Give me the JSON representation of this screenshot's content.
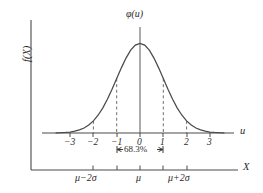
{
  "chart_data": {
    "type": "line",
    "title": "",
    "subtitle": "",
    "curve_label": "φ(u)",
    "ylabel": "f(X)",
    "xlabel_top": "u",
    "xlabel_bottom": "X",
    "distribution": "standard normal probability density",
    "formula": "phi(u) = (1/sqrt(2*pi)) * exp(-u^2/2)",
    "u_axis": {
      "label": "u",
      "ticks": [
        "−3",
        "−2",
        "−1",
        "0",
        "1",
        "2",
        "3"
      ],
      "tick_values": [
        -3,
        -2,
        -1,
        0,
        1,
        2,
        3
      ],
      "xlim": [
        -3.8,
        4.1
      ]
    },
    "x_axis": {
      "label": "X",
      "ticks": [
        "μ−2σ",
        "μ",
        "μ+2σ"
      ],
      "tick_values": [
        -2,
        0,
        2
      ],
      "minor_tick_values": [
        -1,
        1
      ]
    },
    "series": [
      {
        "name": "φ(u)",
        "x": [
          -3.6,
          -3.4,
          -3.2,
          -3.0,
          -2.8,
          -2.6,
          -2.4,
          -2.2,
          -2.0,
          -1.8,
          -1.6,
          -1.4,
          -1.2,
          -1.0,
          -0.8,
          -0.6,
          -0.4,
          -0.2,
          0.0,
          0.2,
          0.4,
          0.6,
          0.8,
          1.0,
          1.2,
          1.4,
          1.6,
          1.8,
          2.0,
          2.2,
          2.4,
          2.6,
          2.8,
          3.0,
          3.2,
          3.4,
          3.6
        ],
        "y": [
          0.0006,
          0.0012,
          0.0024,
          0.0044,
          0.0079,
          0.0136,
          0.0224,
          0.0355,
          0.054,
          0.079,
          0.1109,
          0.1497,
          0.1942,
          0.242,
          0.2897,
          0.3332,
          0.3683,
          0.391,
          0.3989,
          0.391,
          0.3683,
          0.3332,
          0.2897,
          0.242,
          0.1942,
          0.1497,
          0.1109,
          0.079,
          0.054,
          0.0355,
          0.0224,
          0.0136,
          0.0079,
          0.0044,
          0.0024,
          0.0012,
          0.0006
        ],
        "ylim": [
          0,
          0.3989
        ]
      }
    ],
    "dashed_guides": [
      {
        "u": -2,
        "height_fraction": 0.135,
        "style": "dashed"
      },
      {
        "u": -1,
        "height_fraction": 0.607,
        "style": "dashed"
      },
      {
        "u": 1,
        "height_fraction": 0.607,
        "style": "dashed"
      },
      {
        "u": 2,
        "height_fraction": 0.135,
        "style": "dashed"
      }
    ],
    "center_line": {
      "u": 0,
      "style": "solid",
      "from": "axis",
      "to": "above-peak"
    },
    "annotation": {
      "text": "68.3%",
      "span_from": -1,
      "span_to": 1,
      "style": "double-headed-arrow-bracket"
    },
    "grid": false,
    "legend": false
  },
  "colors": {
    "background": "#ffffff",
    "ink": "#3a3a3a",
    "curve": "#4a4a4a",
    "dashed": "#6e6e6e",
    "text": "#2b2b2b"
  }
}
